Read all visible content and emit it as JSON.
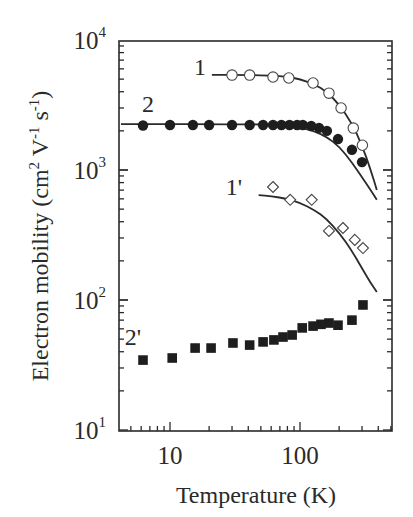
{
  "chart_data": {
    "type": "scatter",
    "title": "",
    "xlabel": "Temperature (K)",
    "ylabel": "Electron mobility (cm^2 V^-1 s^-1)",
    "xscale": "log",
    "yscale": "log",
    "xlim": [
      4,
      500
    ],
    "ylim": [
      10,
      10000
    ],
    "x_ticks": [
      10,
      100
    ],
    "x_tick_labels": [
      "10",
      "100"
    ],
    "y_ticks": [
      10,
      100,
      1000,
      10000
    ],
    "y_tick_labels": [
      {
        "base": "10",
        "exp": "1"
      },
      {
        "base": "10",
        "exp": "2"
      },
      {
        "base": "10",
        "exp": "3"
      },
      {
        "base": "10",
        "exp": "4"
      }
    ],
    "grid": false,
    "legend": "none (inline labels 1, 2, 1', 2')",
    "series": [
      {
        "name": "1",
        "marker": "open-circle",
        "x": [
          30,
          41,
          62,
          82,
          126,
          167,
          207,
          257,
          302
        ],
        "y": [
          5370,
          5370,
          5190,
          5100,
          4670,
          3900,
          3000,
          2100,
          1550
        ],
        "fit_curve": {
          "x": [
            21,
            40,
            60,
            80,
            100,
            130,
            160,
            200,
            250,
            300,
            350,
            390
          ],
          "y": [
            5400,
            5380,
            5330,
            5200,
            5000,
            4550,
            4000,
            3200,
            2300,
            1550,
            1000,
            700
          ]
        },
        "label_pos": [
          200,
          75
        ]
      },
      {
        "name": "2",
        "marker": "filled-circle",
        "x": [
          6.2,
          10,
          15,
          20,
          30,
          41,
          52,
          62,
          72,
          83,
          95,
          105,
          122,
          140,
          161,
          196,
          251,
          300
        ],
        "y": [
          2200,
          2220,
          2220,
          2220,
          2220,
          2220,
          2220,
          2220,
          2220,
          2220,
          2220,
          2220,
          2180,
          2110,
          2000,
          1730,
          1430,
          1150
        ],
        "fit_curve": {
          "x": [
            4.2,
            10,
            20,
            40,
            60,
            80,
            100,
            130,
            160,
            200,
            250,
            300,
            350,
            390
          ],
          "y": [
            2250,
            2250,
            2250,
            2245,
            2230,
            2190,
            2120,
            1980,
            1800,
            1520,
            1150,
            880,
            700,
            590
          ]
        },
        "label_pos": [
          148,
          112
        ]
      },
      {
        "name": "1'",
        "marker": "open-diamond",
        "x": [
          62,
          84,
          123,
          167,
          214,
          264,
          305
        ],
        "y": [
          740,
          590,
          590,
          340,
          358,
          290,
          251
        ],
        "fit_curve": {
          "x": [
            48,
            60,
            80,
            100,
            130,
            160,
            200,
            250,
            300,
            350,
            390
          ],
          "y": [
            640,
            630,
            600,
            560,
            490,
            420,
            330,
            240,
            175,
            135,
            115
          ]
        },
        "label_pos": [
          234,
          195
        ]
      },
      {
        "name": "2'",
        "marker": "filled-square",
        "x": [
          6.2,
          10.4,
          15.6,
          20.7,
          30.5,
          41,
          52,
          63,
          74,
          87,
          104,
          126,
          145,
          167,
          196,
          251,
          305
        ],
        "y": [
          34.5,
          35.8,
          42.7,
          42.7,
          46.7,
          45,
          47.6,
          49.3,
          51.9,
          53.8,
          61,
          63,
          65,
          66.5,
          64,
          70,
          91.6
        ],
        "label_pos": [
          133,
          345
        ]
      }
    ]
  }
}
